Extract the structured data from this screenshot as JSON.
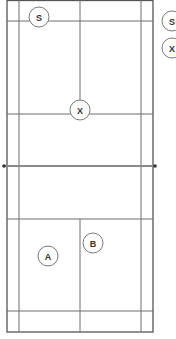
{
  "diagram": {
    "type": "badminton-court",
    "colors": {
      "lines": "#6e6e6e",
      "outer": "#555555",
      "net": "#8a8a8a",
      "post": "#333333",
      "circle_stroke": "#7a7a7a",
      "label": "#333333"
    },
    "players": [
      {
        "id": "S",
        "label": "S",
        "role": "server",
        "cx": 39,
        "cy": 17
      },
      {
        "id": "X",
        "label": "X",
        "role": "opponent",
        "cx": 80,
        "cy": 110
      },
      {
        "id": "A",
        "label": "A",
        "role": "player",
        "cx": 48,
        "cy": 256
      },
      {
        "id": "B",
        "label": "B",
        "role": "player",
        "cx": 93,
        "cy": 243
      }
    ],
    "legend": [
      {
        "label": "S",
        "cx": 172,
        "cy": 21
      },
      {
        "label": "X",
        "cx": 172,
        "cy": 48
      }
    ]
  }
}
